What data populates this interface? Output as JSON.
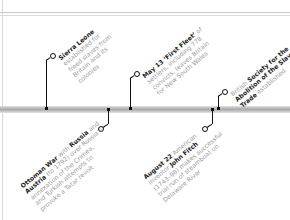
{
  "timeline": {
    "events_above": [
      {
        "id": "sierra-leone",
        "lines": [
          [
            {
              "t": "Sierra Leone",
              "b": true
            }
          ],
          [
            {
              "t": "established for",
              "b": false
            }
          ],
          [
            {
              "t": "freed slaves from",
              "b": false
            }
          ],
          [
            {
              "t": "Britain and its",
              "b": false
            }
          ],
          [
            {
              "t": "colonies",
              "b": false
            }
          ]
        ]
      },
      {
        "id": "first-fleet",
        "lines": [
          [
            {
              "t": "May 13",
              "b": true
            },
            {
              "t": " ",
              "b": false
            },
            {
              "t": "‘First Fleet’",
              "b": true
            },
            {
              "t": " of",
              "b": false
            }
          ],
          [
            {
              "t": "settlers, including 778",
              "b": false
            }
          ],
          [
            {
              "t": "convicts, leaves Britain",
              "b": false
            }
          ],
          [
            {
              "t": "for New South Wales",
              "b": false
            }
          ]
        ]
      },
      {
        "id": "abolition-society",
        "lines": [
          [
            {
              "t": "British ",
              "b": false
            },
            {
              "t": "Society for the",
              "b": true
            }
          ],
          [
            {
              "t": "Abolition of the Slave",
              "b": true
            }
          ],
          [
            {
              "t": "Trade",
              "b": true
            },
            {
              "t": " established",
              "b": false
            }
          ]
        ]
      }
    ],
    "events_below": [
      {
        "id": "ottoman-war",
        "lines": [
          [
            {
              "t": "Ottoman War",
              "b": true
            },
            {
              "t": " with ",
              "b": false
            },
            {
              "t": "Russia",
              "b": true
            },
            {
              "t": " and",
              "b": false
            }
          ],
          [
            {
              "t": "Austria",
              "b": true
            },
            {
              "t": " (to 1792) over Russia’s",
              "b": false
            }
          ],
          [
            {
              "t": "annexation of the Crimea,",
              "b": false
            }
          ],
          [
            {
              "t": "and Turkish attempts to",
              "b": false
            }
          ],
          [
            {
              "t": "provoke a Tatar revolt",
              "b": false
            }
          ]
        ]
      },
      {
        "id": "john-fitch",
        "lines": [
          [
            {
              "t": "August 22",
              "b": true
            },
            {
              "t": " American",
              "b": false
            }
          ],
          [
            {
              "t": "inventor ",
              "b": false
            },
            {
              "t": "John Fitch",
              "b": true
            }
          ],
          [
            {
              "t": "(1743–98) makes successful",
              "b": false
            }
          ],
          [
            {
              "t": "trial run of steamboat on",
              "b": false
            }
          ],
          [
            {
              "t": "Delaware River",
              "b": false
            }
          ]
        ]
      }
    ]
  },
  "colors": {
    "text_bold": "#1a1a1a",
    "text_light": "#9a9a9a",
    "marker": "#111111",
    "bar": "#b0b0b0"
  }
}
